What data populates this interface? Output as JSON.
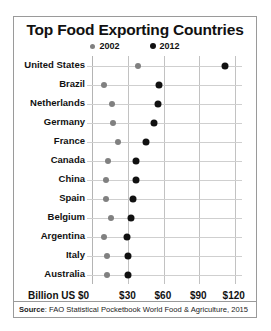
{
  "chart_data": {
    "type": "scatter",
    "title": "Top Food Exporting Countries",
    "xlabel": "Billion US $",
    "ylabel": "",
    "xlim": [
      0,
      127
    ],
    "grid": true,
    "legend_position": "top-center",
    "xticks": [
      "Billion US $0",
      "$30",
      "$60",
      "$90",
      "$120"
    ],
    "xtick_values": [
      0,
      30,
      60,
      90,
      120
    ],
    "categories": [
      "United States",
      "Brazil",
      "Netherlands",
      "Germany",
      "France",
      "Canada",
      "China",
      "Spain",
      "Belgium",
      "Argentina",
      "Italy",
      "Australia"
    ],
    "series": [
      {
        "name": "2002",
        "color": "#808080",
        "values": [
          38,
          9,
          16,
          17,
          21,
          13,
          11,
          11,
          15,
          9,
          12,
          12
        ]
      },
      {
        "name": "2012",
        "color": "#111111",
        "values": [
          112,
          56,
          55,
          52,
          45,
          36,
          36,
          34,
          32,
          29,
          30,
          30
        ]
      }
    ],
    "source_prefix": "Source",
    "source_text": ": FAO Statistical Pocketbook World Food & Agriculture, 2015"
  }
}
